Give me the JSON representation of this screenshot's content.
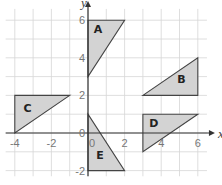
{
  "axes": {
    "x_label": "x",
    "y_label": "y",
    "x_ticks": [
      {
        "v": -4,
        "t": "-4"
      },
      {
        "v": -2,
        "t": "-2"
      },
      {
        "v": 2,
        "t": "2"
      },
      {
        "v": 4,
        "t": "4"
      },
      {
        "v": 6,
        "t": "6"
      }
    ],
    "y_ticks": [
      {
        "v": 6,
        "t": "6"
      },
      {
        "v": 4,
        "t": "4"
      },
      {
        "v": 2,
        "t": "2"
      },
      {
        "v": 0,
        "t": "0"
      },
      {
        "v": -2,
        "t": "-2"
      }
    ],
    "origin_label": "0",
    "x_range": [
      -4.5,
      6.5
    ],
    "y_range": [
      -2.3,
      6.6
    ]
  },
  "shapes": [
    {
      "name": "A",
      "points": [
        [
          0,
          3
        ],
        [
          0,
          6
        ],
        [
          2,
          6
        ]
      ],
      "label_at": [
        0.55,
        5.3
      ]
    },
    {
      "name": "B",
      "points": [
        [
          3,
          2
        ],
        [
          6,
          2
        ],
        [
          6,
          4
        ]
      ],
      "label_at": [
        5.1,
        2.65
      ]
    },
    {
      "name": "C",
      "points": [
        [
          -4,
          0
        ],
        [
          -4,
          2
        ],
        [
          -1,
          2
        ]
      ],
      "label_at": [
        -3.3,
        1.1
      ]
    },
    {
      "name": "D",
      "points": [
        [
          3,
          -1
        ],
        [
          3,
          1
        ],
        [
          6,
          1
        ]
      ],
      "label_at": [
        3.6,
        0.3
      ]
    },
    {
      "name": "E",
      "points": [
        [
          0,
          1
        ],
        [
          0,
          -2
        ],
        [
          2,
          -2
        ]
      ],
      "label_at": [
        0.65,
        -1.4
      ]
    }
  ],
  "colors": {
    "fill": "#d3d3d3",
    "stroke": "#444444",
    "grid": "#d6d6d6"
  }
}
